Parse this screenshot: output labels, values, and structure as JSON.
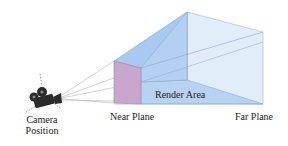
{
  "diagram": {
    "labels": {
      "camera_line1": "Camera",
      "camera_line2": "Position",
      "near_plane": "Near Plane",
      "far_plane": "Far Plane",
      "render_area": "Render Area"
    },
    "icons": {
      "camera": "movie-camera-icon"
    },
    "colors": {
      "near_plane": "#c9a3c8",
      "frustum_side": "#a9c8ef",
      "frustum_top": "#b7d3f3",
      "far_plane": "#deebf8",
      "bottom": "#b8d3f2",
      "edge": "#8aa6c8",
      "sight_line": "#b8b8b8"
    }
  }
}
